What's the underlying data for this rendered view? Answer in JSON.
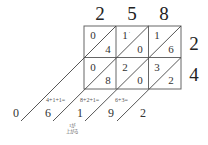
{
  "diagram": {
    "type": "lattice-multiplication",
    "multiplicand_digits": [
      "2",
      "5",
      "8"
    ],
    "multiplier_digits": [
      "2",
      "4"
    ],
    "cells": [
      [
        {
          "tens": "0",
          "ones": "4"
        },
        {
          "tens": "1",
          "ones": "0",
          "mark": "'"
        },
        {
          "tens": "1",
          "ones": "6"
        }
      ],
      [
        {
          "tens": "0",
          "ones": "8"
        },
        {
          "tens": "2",
          "ones": "0"
        },
        {
          "tens": "3",
          "ones": "2"
        }
      ]
    ],
    "diagonal_sums": [
      {
        "label": "4+1+1=",
        "result": "6"
      },
      {
        "label": "8+2+1=",
        "result": "1"
      },
      {
        "label": "6+3=",
        "result": "9"
      }
    ],
    "result_digits": [
      "0",
      "6",
      "1",
      "9",
      "2"
    ],
    "carry_note_line1": "1が",
    "carry_note_line2": "上がる",
    "line_color": "#555555",
    "text_color": "#222222"
  }
}
